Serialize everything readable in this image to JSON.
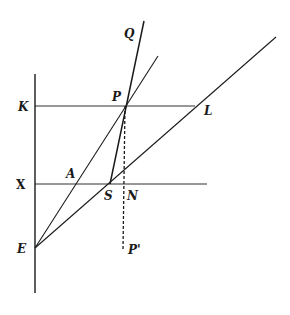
{
  "figure": {
    "type": "geometric-construction",
    "labels": {
      "Q": "Q",
      "P": "P",
      "K": "K",
      "L": "L",
      "X": "X",
      "A": "A",
      "S": "S",
      "N": "N",
      "E": "E",
      "P_prime": "P'"
    },
    "points": {
      "P": [
        125,
        106
      ],
      "E": [
        35,
        248
      ],
      "S": [
        110,
        184
      ],
      "A": [
        76,
        184
      ],
      "N": [
        125,
        184
      ],
      "L": [
        195,
        106
      ],
      "K": [
        35,
        106
      ],
      "X": [
        35,
        184
      ],
      "P_prime": [
        125,
        250
      ],
      "Q_end": [
        144,
        21
      ]
    },
    "stroke_color": "#1a1a1a",
    "background": "#ffffff"
  }
}
